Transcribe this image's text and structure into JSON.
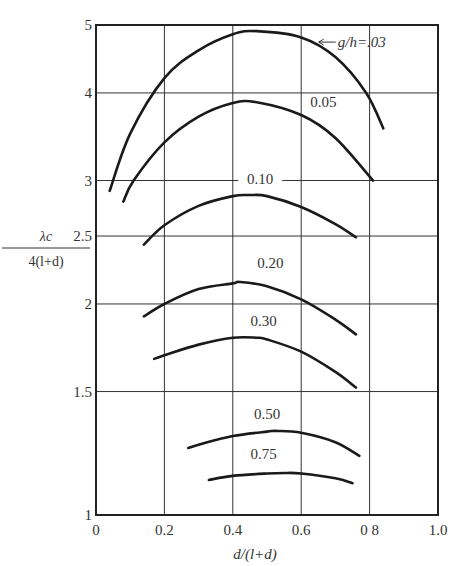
{
  "chart_data": {
    "type": "line",
    "title": "",
    "xlabel": "d/(l+d)",
    "ylabel": "λc / 4(l+d)",
    "ylabel_numerator": "λc",
    "ylabel_denominator": "4(l+d)",
    "xlim": [
      0,
      1.0
    ],
    "ylim": [
      1,
      5
    ],
    "yscale": "log",
    "grid": true,
    "legend_position": "inline labels on curves",
    "x_ticks": [
      "0",
      "0.2",
      "0.4",
      "0.6",
      "0 8",
      "1.0"
    ],
    "x_tick_values": [
      0,
      0.2,
      0.4,
      0.6,
      0.8,
      1.0
    ],
    "y_ticks": [
      "1",
      "1.5",
      "2",
      "2.5",
      "3",
      "4",
      "5"
    ],
    "y_tick_values": [
      1,
      1.5,
      2,
      2.5,
      3,
      4,
      5
    ],
    "series": [
      {
        "name": "g/h=.03",
        "label": "g/h=.03",
        "x": [
          0.04,
          0.1,
          0.2,
          0.3,
          0.4,
          0.47,
          0.6,
          0.7,
          0.79,
          0.84
        ],
        "y": [
          2.9,
          3.5,
          4.2,
          4.6,
          4.85,
          4.9,
          4.8,
          4.5,
          4.0,
          3.56
        ]
      },
      {
        "name": "0.05",
        "label": "0.05",
        "x": [
          0.08,
          0.11,
          0.2,
          0.3,
          0.4,
          0.47,
          0.6,
          0.7,
          0.81
        ],
        "y": [
          2.8,
          3.0,
          3.4,
          3.7,
          3.87,
          3.88,
          3.72,
          3.45,
          3.0
        ]
      },
      {
        "name": "0.10",
        "label": "0.10",
        "x": [
          0.14,
          0.2,
          0.3,
          0.4,
          0.45,
          0.5,
          0.6,
          0.7,
          0.76
        ],
        "y": [
          2.43,
          2.59,
          2.76,
          2.85,
          2.86,
          2.85,
          2.75,
          2.6,
          2.49
        ]
      },
      {
        "name": "0.20",
        "label": "0.20",
        "x": [
          0.14,
          0.2,
          0.3,
          0.4,
          0.42,
          0.5,
          0.6,
          0.7,
          0.76
        ],
        "y": [
          1.92,
          2.0,
          2.1,
          2.14,
          2.15,
          2.12,
          2.03,
          1.9,
          1.81
        ]
      },
      {
        "name": "0.30",
        "label": "0.30",
        "x": [
          0.17,
          0.2,
          0.3,
          0.4,
          0.47,
          0.5,
          0.6,
          0.7,
          0.76
        ],
        "y": [
          1.67,
          1.69,
          1.75,
          1.79,
          1.79,
          1.78,
          1.71,
          1.6,
          1.52
        ]
      },
      {
        "name": "0.50",
        "label": "0.50",
        "x": [
          0.27,
          0.3,
          0.4,
          0.5,
          0.53,
          0.6,
          0.7,
          0.77
        ],
        "y": [
          1.246,
          1.26,
          1.296,
          1.315,
          1.318,
          1.31,
          1.27,
          1.214
        ]
      },
      {
        "name": "0.75",
        "label": "0.75",
        "x": [
          0.33,
          0.4,
          0.5,
          0.55,
          0.6,
          0.7,
          0.75
        ],
        "y": [
          1.122,
          1.137,
          1.146,
          1.148,
          1.146,
          1.128,
          1.11
        ]
      }
    ],
    "annotations": [
      {
        "text": "←g/h=.03",
        "x": 0.76,
        "y": 4.65,
        "points_to": "g/h=.03 curve"
      }
    ],
    "label_positions": [
      {
        "series": "g/h=.03",
        "x": 0.66,
        "y": 4.65,
        "text": "g/h=.03",
        "arrow": true
      },
      {
        "series": "0.05",
        "x": 0.665,
        "y": 3.82,
        "text": "0.05"
      },
      {
        "series": "0.10",
        "x": 0.48,
        "y": 2.97,
        "text": "0.10",
        "line_through": true
      },
      {
        "series": "0.20",
        "x": 0.51,
        "y": 2.25,
        "text": "0.20"
      },
      {
        "series": "0.30",
        "x": 0.49,
        "y": 1.86,
        "text": "0.30"
      },
      {
        "series": "0.50",
        "x": 0.5,
        "y": 1.37,
        "text": "0.50"
      },
      {
        "series": "0.75",
        "x": 0.49,
        "y": 1.2,
        "text": "0.75"
      }
    ]
  }
}
